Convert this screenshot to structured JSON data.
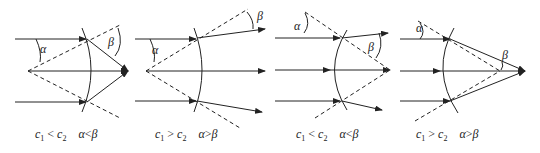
{
  "panels": [
    {
      "id": 1,
      "relation_c": "c1 < c2",
      "relation_angle": "α < β",
      "c_left": "c",
      "c_left_sub": "1",
      "op_c": "<",
      "c_right": "c",
      "c_right_sub": "2",
      "angle_left": "α",
      "op_angle": "<",
      "angle_right": "β",
      "alpha_label": "α",
      "beta_label": "β"
    },
    {
      "id": 2,
      "relation_c": "c1 > c2",
      "relation_angle": "α > β",
      "c_left": "c",
      "c_left_sub": "1",
      "op_c": ">",
      "c_right": "c",
      "c_right_sub": "2",
      "angle_left": "α",
      "op_angle": ">",
      "angle_right": "β",
      "alpha_label": "α",
      "beta_label": "β"
    },
    {
      "id": 3,
      "relation_c": "c1 < c2",
      "relation_angle": "α < β",
      "c_left": "c",
      "c_left_sub": "1",
      "op_c": "<",
      "c_right": "c",
      "c_right_sub": "2",
      "angle_left": "α",
      "op_angle": "<",
      "angle_right": "β",
      "alpha_label": "α",
      "beta_label": "β"
    },
    {
      "id": 4,
      "relation_c": "c1 > c2",
      "relation_angle": "α > β",
      "c_left": "c",
      "c_left_sub": "1",
      "op_c": ">",
      "c_right": "c",
      "c_right_sub": "2",
      "angle_left": "α",
      "op_angle": ">",
      "angle_right": "β",
      "alpha_label": "α",
      "beta_label": "β"
    }
  ],
  "colors": {
    "line": "#222222",
    "background": "#ffffff"
  }
}
